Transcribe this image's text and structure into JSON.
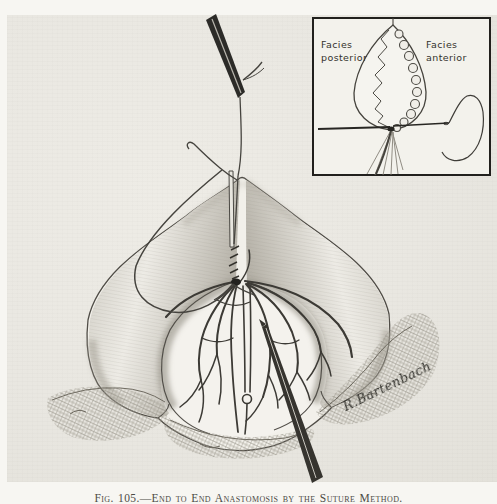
{
  "figure": {
    "caption": "Fig. 105.—End to End Anastomosis by the Suture Method.",
    "signature": "R.Bartenbach"
  },
  "inset": {
    "label_left_line1": "Facies",
    "label_left_line2": "posterior",
    "label_right_line1": "Facies",
    "label_right_line2": "anterior"
  },
  "colors": {
    "page_background": "#f7f6f2",
    "paper": "#e9e7e1",
    "ink": "#3b3936",
    "shading_gray": "#a6a298"
  }
}
